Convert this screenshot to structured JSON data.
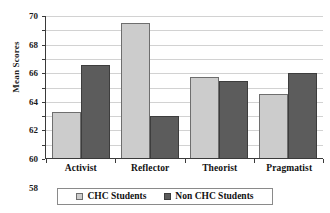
{
  "chart_data": {
    "type": "bar",
    "title": "",
    "xlabel": "",
    "ylabel": "Mean Scores",
    "ylim": [
      50,
      70
    ],
    "ytick_step": 2,
    "yticks": [
      70,
      68,
      66,
      64,
      62,
      60,
      58,
      56,
      54,
      52,
      50
    ],
    "grid": true,
    "legend_position": "bottom",
    "categories": [
      "Activist",
      "Reflector",
      "Theorist",
      "Pragmatist"
    ],
    "series": [
      {
        "name": "CHC Students",
        "color": "#cccccc",
        "values": [
          56.5,
          68.9,
          61.4,
          58.9
        ]
      },
      {
        "name": "Non CHC Students",
        "color": "#5c5c5c",
        "values": [
          63.0,
          55.9,
          60.8,
          61.9
        ]
      }
    ]
  },
  "legend": {
    "items": [
      {
        "label": "CHC Students",
        "swatch": "legend-swatch-chc"
      },
      {
        "label": "Non CHC Students",
        "swatch": "legend-swatch-non-chc"
      }
    ]
  }
}
